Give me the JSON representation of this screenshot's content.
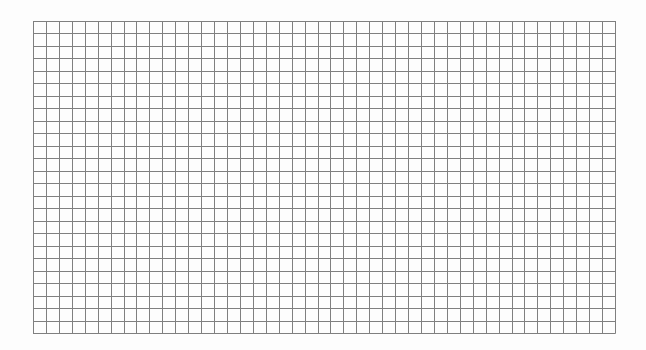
{
  "grid": {
    "columns": 45,
    "rows": 25,
    "left": 33,
    "top": 21,
    "width": 582,
    "height": 312,
    "line_color": "#7f7f7f",
    "background_color": "#fdfdfd"
  }
}
